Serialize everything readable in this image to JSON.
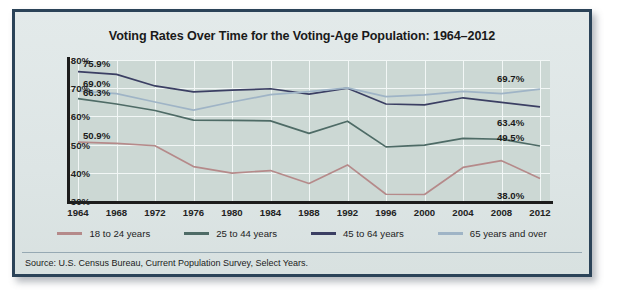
{
  "chart_data": {
    "type": "line",
    "title": "Voting Rates Over Time for the Voting-Age Population: 1964–2012",
    "xlabel": "",
    "ylabel": "",
    "ylim": [
      30,
      80
    ],
    "yticks": [
      "30%",
      "40%",
      "50%",
      "60%",
      "70%",
      "80%"
    ],
    "ytick_values": [
      30,
      40,
      50,
      60,
      70,
      80
    ],
    "grid": true,
    "legend_position": "bottom",
    "categories": [
      1964,
      1968,
      1972,
      1976,
      1980,
      1984,
      1988,
      1992,
      1996,
      2000,
      2004,
      2008,
      2012
    ],
    "xtick_labels": [
      "1964",
      "1968",
      "1972",
      "1976",
      "1980",
      "1984",
      "1988",
      "1992",
      "1996",
      "2000",
      "2004",
      "2008",
      "2012"
    ],
    "series": [
      {
        "name": "18 to 24 years",
        "color": "#b58a8a",
        "values": [
          50.9,
          50.4,
          49.6,
          42.2,
          39.9,
          40.8,
          36.2,
          42.8,
          32.4,
          32.3,
          41.9,
          44.3,
          38.0
        ],
        "start_label": "50.9%",
        "end_label": "38.0%"
      },
      {
        "name": "25 to 44 years",
        "color": "#4e6b66",
        "values": [
          66.3,
          64.4,
          62.1,
          58.7,
          58.6,
          58.4,
          54.0,
          58.3,
          49.2,
          49.8,
          52.2,
          51.9,
          49.5
        ],
        "start_label": "66.3%",
        "end_label": "49.5%"
      },
      {
        "name": "45 to 64 years",
        "color": "#3b3f63",
        "values": [
          75.9,
          74.9,
          70.8,
          68.7,
          69.3,
          69.8,
          67.9,
          70.0,
          64.4,
          64.1,
          66.6,
          65.0,
          63.4
        ],
        "start_label": "75.9%",
        "end_label": "63.4%"
      },
      {
        "name": "65 years and over",
        "color": "#9fb4c6",
        "values": [
          69.0,
          68.1,
          65.1,
          62.2,
          65.1,
          67.7,
          68.8,
          70.1,
          67.0,
          67.6,
          68.9,
          68.1,
          69.7
        ],
        "start_label": "69.0%",
        "end_label": "69.7%"
      }
    ],
    "annotations_left": [
      "75.9%",
      "69.0%",
      "66.3%",
      "50.9%"
    ],
    "annotations_right": [
      "69.7%",
      "63.4%",
      "49.5%",
      "38.0%"
    ]
  },
  "source": {
    "text": "Source: U.S. Census Bureau, Current Population Survey, Select Years."
  }
}
